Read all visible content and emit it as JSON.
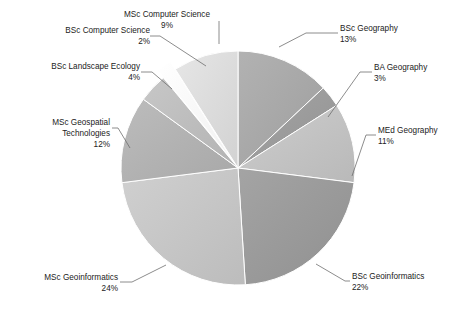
{
  "chart_data": {
    "type": "pie",
    "title": "",
    "subtitle": "",
    "xlabel": "",
    "ylabel": "",
    "legend_position": "none",
    "grid": false,
    "start_angle_deg": 0,
    "direction": "clockwise",
    "categories": [
      "BSc Geography",
      "BA Geography",
      "MEd Geography",
      "BSc Geoinformatics",
      "MSc Geoinformatics",
      "MSc Geospatial Technologies",
      "BSc Landscape Ecology",
      "BSc Computer Science",
      "MSc Computer Science"
    ],
    "values": [
      13,
      3,
      11,
      22,
      24,
      12,
      4,
      2,
      9
    ],
    "unit": "%",
    "slices": [
      {
        "label": "BSc Geography",
        "value": 13,
        "pct_text": "13%",
        "color": "#a8a8a8",
        "exploded": false,
        "label_lines": [
          "BSc Geography",
          "13%"
        ]
      },
      {
        "label": "BA Geography",
        "value": 3,
        "pct_text": "3%",
        "color": "#9c9c9c",
        "exploded": false,
        "label_lines": [
          "BA Geography",
          "3%"
        ]
      },
      {
        "label": "MEd Geography",
        "value": 11,
        "pct_text": "11%",
        "color": "#c3c3c3",
        "exploded": false,
        "label_lines": [
          "MEd Geography",
          "11%"
        ]
      },
      {
        "label": "BSc Geoinformatics",
        "value": 22,
        "pct_text": "22%",
        "color": "#9a9a9a",
        "exploded": false,
        "label_lines": [
          "BSc Geoinformatics",
          "22%"
        ]
      },
      {
        "label": "MSc Geoinformatics",
        "value": 24,
        "pct_text": "24%",
        "color": "#c6c6c6",
        "exploded": false,
        "label_lines": [
          "MSc Geoinformatics",
          "24%"
        ]
      },
      {
        "label": "MSc Geospatial Technologies",
        "value": 12,
        "pct_text": "12%",
        "color": "#b2b2b2",
        "exploded": false,
        "label_lines": [
          "MSc Geospatial",
          "Technologies",
          "12%"
        ]
      },
      {
        "label": "BSc Landscape Ecology",
        "value": 4,
        "pct_text": "4%",
        "color": "#bdbdbd",
        "exploded": false,
        "label_lines": [
          "BSc Landscape Ecology",
          "4%"
        ]
      },
      {
        "label": "BSc Computer Science",
        "value": 2,
        "pct_text": "2%",
        "color": "#fbfbfb",
        "exploded": true,
        "label_lines": [
          "BSc Computer Science",
          "2%"
        ]
      },
      {
        "label": "MSc Computer Science",
        "value": 9,
        "pct_text": "9%",
        "color": "#dcdcdc",
        "exploded": false,
        "label_lines": [
          "MSc Computer Science",
          "9%"
        ]
      }
    ],
    "geometry": {
      "center_x": 238,
      "center_y": 168,
      "radius": 117
    },
    "colors": {
      "background": "#ffffff",
      "leader_line": "#6e6e6e",
      "text": "#222222"
    }
  }
}
